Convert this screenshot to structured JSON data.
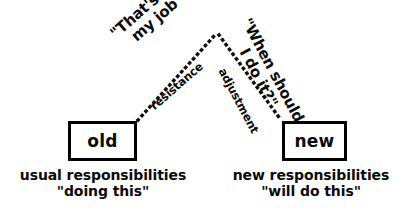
{
  "diagram": {
    "background_color": "#ffffff",
    "ink_color": "#0a0a0a",
    "nodes": [
      {
        "id": "old",
        "label": "old",
        "caption_line1": "usual responsibilities",
        "caption_line2": "\"doing this\""
      },
      {
        "id": "new",
        "label": "new",
        "caption_line1": "new responsibilities",
        "caption_line2": "\"will do this\""
      }
    ],
    "edges": [
      {
        "id": "resistance",
        "from": "old",
        "to": "apex",
        "style": "dotted",
        "flow_label": "resistance",
        "quote_line1": "\"That's not",
        "quote_line2": "my job\""
      },
      {
        "id": "adjustment",
        "from": "apex",
        "to": "new",
        "style": "dotted",
        "flow_label": "adjustment",
        "quote_line1": "\"When should",
        "quote_line2": "I do it?\""
      }
    ]
  }
}
